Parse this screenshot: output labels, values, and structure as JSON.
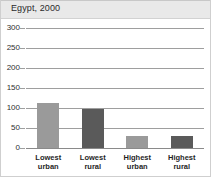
{
  "figure": {
    "title": "Egypt, 2000"
  },
  "chart_data": {
    "type": "bar",
    "title": "Egypt, 2000",
    "xlabel": "",
    "ylabel": "",
    "categories": [
      "Lowest urban",
      "Lowest rural",
      "Highest urban",
      "Highest rural"
    ],
    "category_lines": [
      [
        "Lowest",
        "urban"
      ],
      [
        "Lowest",
        "rural"
      ],
      [
        "Highest",
        "urban"
      ],
      [
        "Highest",
        "rural"
      ]
    ],
    "values": [
      112,
      97,
      30,
      31
    ],
    "ylim": [
      0,
      300
    ],
    "yticks": [
      0,
      50,
      100,
      150,
      200,
      250,
      300
    ],
    "ytick_labels": [
      "0",
      "50",
      "100",
      "150",
      "200",
      "250",
      "300"
    ],
    "grid": true,
    "legend": "none",
    "bar_colors": [
      "#9a9a9a",
      "#5a5a5a",
      "#9a9a9a",
      "#5a5a5a"
    ]
  },
  "colors": {
    "urban_bar": "#9a9a9a",
    "rural_bar": "#5a5a5a",
    "title_band": "#e9e9e9",
    "gridline": "#9e9e9e",
    "frame": "#cfcfcf",
    "plot_background": "#ffffff"
  }
}
